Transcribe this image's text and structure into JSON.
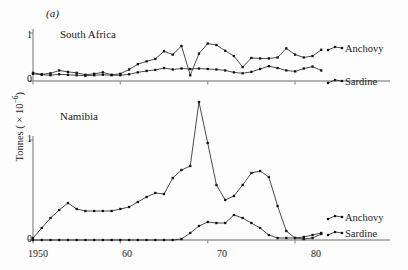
{
  "figure": {
    "panel_label": "(a)",
    "y_axis_label_prefix": "Tonnes ( × 10",
    "y_axis_label_exponent": "−6",
    "y_axis_label_suffix": ")",
    "line_color": "#2b2b2b",
    "axis_color": "#9a9a9a",
    "marker_color": "#111111",
    "background": "#fdfdfd"
  },
  "axes": {
    "x_ticks": [
      "1950",
      "60",
      "70",
      "80"
    ],
    "x_tick_years": [
      1950,
      1960,
      1970,
      1980
    ],
    "y_ticks": [
      "0",
      "1"
    ],
    "xlim": [
      1950,
      1984
    ],
    "ylim": [
      0,
      1.05
    ]
  },
  "panels": [
    {
      "id": "south-africa",
      "title": "South Africa",
      "legend": [
        "Anchovy",
        "Sardine"
      ]
    },
    {
      "id": "namibia",
      "title": "Namibia",
      "legend": [
        "Anchovy",
        "Sardine"
      ]
    }
  ],
  "chart_data": [
    {
      "type": "line",
      "title": "South Africa",
      "panel_label": "(a)",
      "xlabel": "",
      "ylabel": "Tonnes ( × 10−6)",
      "xlim": [
        1950,
        1984
      ],
      "ylim": [
        0,
        1.05
      ],
      "xticks": [
        1950,
        1960,
        1970,
        1980
      ],
      "xticklabels": [
        "1950",
        "60",
        "70",
        "80"
      ],
      "yticks": [
        0,
        1
      ],
      "yticklabels": [
        "0",
        "1"
      ],
      "grid": false,
      "legend_position": "right",
      "x": [
        1950,
        1951,
        1952,
        1953,
        1954,
        1955,
        1956,
        1957,
        1958,
        1959,
        1960,
        1961,
        1962,
        1963,
        1964,
        1965,
        1966,
        1967,
        1968,
        1969,
        1970,
        1971,
        1972,
        1973,
        1974,
        1975,
        1976,
        1977,
        1978,
        1979,
        1980,
        1981,
        1982,
        1983
      ],
      "series": [
        {
          "name": "Anchovy",
          "values": [
            0.17,
            0.14,
            0.16,
            0.22,
            0.19,
            0.17,
            0.13,
            0.15,
            0.18,
            0.13,
            0.15,
            0.24,
            0.35,
            0.41,
            0.46,
            0.62,
            0.55,
            0.73,
            0.12,
            0.57,
            0.78,
            0.75,
            0.63,
            0.52,
            0.29,
            0.48,
            0.47,
            0.47,
            0.49,
            0.68,
            0.55,
            0.49,
            0.52,
            0.65,
            0.63
          ]
        },
        {
          "name": "Sardine",
          "values": [
            0.15,
            0.13,
            0.12,
            0.14,
            0.13,
            0.12,
            0.11,
            0.12,
            0.13,
            0.12,
            0.12,
            0.14,
            0.18,
            0.21,
            0.23,
            0.27,
            0.24,
            0.26,
            0.25,
            0.26,
            0.25,
            0.24,
            0.22,
            0.18,
            0.16,
            0.19,
            0.25,
            0.31,
            0.27,
            0.22,
            0.2,
            0.26,
            0.3,
            0.22,
            0.18,
            0.12,
            0.11,
            0.1
          ]
        }
      ]
    },
    {
      "type": "line",
      "title": "Namibia",
      "panel_label": "",
      "xlabel": "",
      "ylabel": "Tonnes ( × 10−6)",
      "xlim": [
        1950,
        1984
      ],
      "ylim": [
        0,
        1.45
      ],
      "xticks": [
        1950,
        1960,
        1970,
        1980
      ],
      "xticklabels": [
        "1950",
        "60",
        "70",
        "80"
      ],
      "yticks": [
        0,
        1
      ],
      "yticklabels": [
        "0",
        "1"
      ],
      "grid": false,
      "legend_position": "right",
      "x": [
        1950,
        1951,
        1952,
        1953,
        1954,
        1955,
        1956,
        1957,
        1958,
        1959,
        1960,
        1961,
        1962,
        1963,
        1964,
        1965,
        1966,
        1967,
        1968,
        1969,
        1970,
        1971,
        1972,
        1973,
        1974,
        1975,
        1976,
        1977,
        1978,
        1979,
        1980,
        1981,
        1982,
        1983
      ],
      "series": [
        {
          "name": "Anchovy",
          "values": [
            0.02,
            0.12,
            0.22,
            0.3,
            0.37,
            0.31,
            0.29,
            0.29,
            0.29,
            0.29,
            0.31,
            0.33,
            0.38,
            0.43,
            0.47,
            0.46,
            0.62,
            0.7,
            0.74,
            1.38,
            0.97,
            0.55,
            0.4,
            0.44,
            0.55,
            0.67,
            0.69,
            0.63,
            0.34,
            0.09,
            0.02,
            0.01,
            0.02,
            0.06
          ]
        },
        {
          "name": "Sardine",
          "values": [
            0.0,
            0.0,
            0.0,
            0.0,
            0.0,
            0.0,
            0.0,
            0.0,
            0.0,
            0.0,
            0.0,
            0.0,
            0.0,
            0.0,
            0.0,
            0.0,
            0.0,
            0.01,
            0.07,
            0.14,
            0.18,
            0.17,
            0.17,
            0.25,
            0.22,
            0.17,
            0.12,
            0.05,
            0.02,
            0.02,
            0.02,
            0.03,
            0.05,
            0.07
          ]
        }
      ]
    }
  ]
}
